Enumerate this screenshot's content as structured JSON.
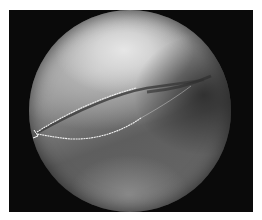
{
  "image": {
    "description": "Grayscale arthroscopic view in a circular field with two thin bright suture lines converging at the left edge",
    "colors": {
      "frame": "#0a0a0a",
      "tissue_bright": "#e6e6e6",
      "tissue_mid": "#8e8e8e",
      "tissue_dark": "#5e5e5e",
      "suture": "#f2f2f2"
    }
  }
}
